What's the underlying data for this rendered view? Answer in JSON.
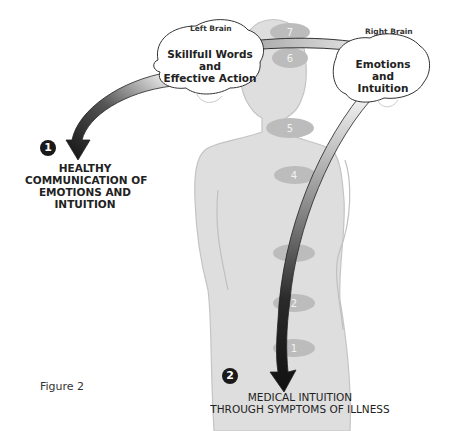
{
  "diagram": {
    "left_brain": {
      "label": "Left Brain",
      "line1": "Skillfull Words",
      "line2": "and",
      "line3": "Effective Action"
    },
    "right_brain": {
      "label": "Right Brain",
      "line1": "Emotions",
      "line2": "and",
      "line3": "Intuition"
    },
    "path1": {
      "number": "1",
      "line1": "HEALTHY",
      "line2": "COMMUNICATION OF",
      "line3": "EMOTIONS AND",
      "line4": "INTUITION"
    },
    "path2": {
      "number": "2",
      "line1": "MEDICAL INTUITION",
      "line2": "THROUGH SYMPTOMS OF ILLNESS"
    },
    "chakras": [
      "7",
      "6",
      "5",
      "4",
      "3",
      "2",
      "1"
    ],
    "figure_caption": "Figure 2",
    "colors": {
      "body": "#dcdcdc",
      "chakra": "#b8b8b8",
      "arrow_dark": "#1a1a1a",
      "text": "#222222"
    }
  }
}
